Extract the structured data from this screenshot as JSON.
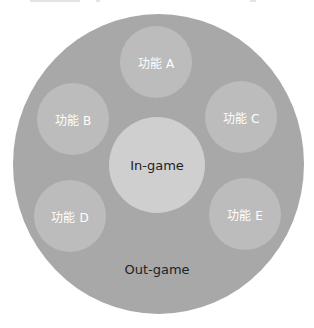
{
  "diagram": {
    "outer": {
      "label": "Out-game",
      "color": "#a8a8a8"
    },
    "center": {
      "label": "In-game",
      "color": "#cfcfcf"
    },
    "features": [
      {
        "label": "功能 A"
      },
      {
        "label": "功能 B"
      },
      {
        "label": "功能 C"
      },
      {
        "label": "功能 D"
      },
      {
        "label": "功能 E"
      }
    ],
    "feature_color": "#bcbcbc"
  }
}
